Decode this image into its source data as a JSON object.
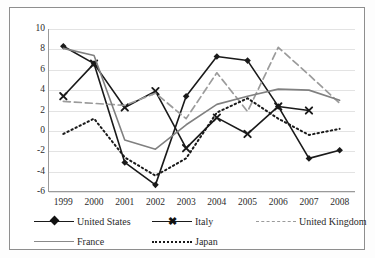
{
  "chart_data": {
    "type": "line",
    "title": "",
    "subtitle": "",
    "xlabel": "",
    "ylabel": "",
    "x": [
      "1999",
      "2000",
      "2001",
      "2002",
      "2003",
      "2004",
      "2005",
      "2006",
      "2007",
      "2008"
    ],
    "categories": [
      "1999",
      "2000",
      "2001",
      "2002",
      "2003",
      "2004",
      "2005",
      "2006",
      "2007",
      "2008"
    ],
    "ylim": [
      -6,
      10
    ],
    "ytick_labels": [
      "10",
      "8",
      "6",
      "4",
      "2",
      "0",
      "-2",
      "-4",
      "-6"
    ],
    "yticks": [
      10,
      8,
      6,
      4,
      2,
      0,
      -2,
      -4,
      -6
    ],
    "grid": true,
    "grid_axis": "y",
    "legend_position": "bottom",
    "series": [
      {
        "name": "United States",
        "color": "#1a1a1a",
        "style": "solid",
        "marker": "diamond",
        "values": [
          8.3,
          6.6,
          -3.1,
          -5.3,
          3.4,
          7.3,
          6.9,
          2.4,
          -2.7,
          -1.9
        ]
      },
      {
        "name": "Italy",
        "color": "#1a1a1a",
        "style": "solid",
        "marker": "cross",
        "values": [
          3.4,
          6.6,
          2.3,
          3.9,
          -1.7,
          1.3,
          -0.3,
          2.4,
          2.0,
          null
        ]
      },
      {
        "name": "United Kingdom",
        "color": "#9b9b9b",
        "style": "dashed",
        "marker": "none",
        "values": [
          2.9,
          2.7,
          2.5,
          3.7,
          1.2,
          5.7,
          1.9,
          8.2,
          5.5,
          2.7
        ]
      },
      {
        "name": "France",
        "color": "#808080",
        "style": "solid",
        "marker": "none",
        "values": [
          8.1,
          7.4,
          -0.9,
          -1.8,
          0.6,
          2.6,
          3.4,
          4.1,
          4.0,
          3.0
        ]
      },
      {
        "name": "Japan",
        "color": "#1a1a1a",
        "style": "dotted",
        "marker": "none",
        "values": [
          -0.3,
          1.2,
          -2.6,
          -4.4,
          -2.7,
          1.8,
          3.2,
          1.2,
          -0.4,
          0.2
        ]
      }
    ]
  },
  "legend": {
    "items": [
      {
        "label": "United States"
      },
      {
        "label": "Italy"
      },
      {
        "label": "United Kingdom"
      },
      {
        "label": "France"
      },
      {
        "label": "Japan"
      }
    ]
  }
}
